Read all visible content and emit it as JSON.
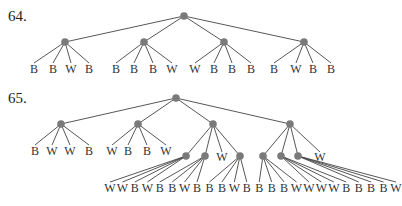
{
  "problems": [
    {
      "number": "64.",
      "root": [
        184,
        16
      ],
      "children": [
        {
          "pos": [
            65,
            42
          ],
          "leaves": [
            {
              "x": 34,
              "t": "B"
            },
            {
              "x": 53,
              "t": "B"
            },
            {
              "x": 71,
              "t": "W"
            },
            {
              "x": 89,
              "t": "B"
            }
          ]
        },
        {
          "pos": [
            144,
            42
          ],
          "leaves": [
            {
              "x": 116,
              "t": "B"
            },
            {
              "x": 134,
              "t": "B"
            },
            {
              "x": 153,
              "t": "B"
            },
            {
              "x": 172,
              "t": "W"
            }
          ]
        },
        {
          "pos": [
            224,
            42
          ],
          "leaves": [
            {
              "x": 195,
              "t": "W"
            },
            {
              "x": 214,
              "t": "B"
            },
            {
              "x": 232,
              "t": "B"
            },
            {
              "x": 251,
              "t": "B"
            }
          ]
        },
        {
          "pos": [
            304,
            42
          ],
          "leaves": [
            {
              "x": 274,
              "t": "B"
            },
            {
              "x": 296,
              "t": "W"
            },
            {
              "x": 313,
              "t": "B"
            },
            {
              "x": 331,
              "t": "B"
            }
          ]
        }
      ],
      "leaf_y": 73
    },
    {
      "number": "65.",
      "root": [
        176,
        98
      ],
      "children": [
        {
          "pos": [
            61,
            124
          ],
          "leaves": [
            {
              "x": 35,
              "t": "B"
            },
            {
              "x": 52,
              "t": "W"
            },
            {
              "x": 70,
              "t": "W"
            },
            {
              "x": 89,
              "t": "B"
            }
          ]
        },
        {
          "pos": [
            138,
            124
          ],
          "leaves": [
            {
              "x": 112,
              "t": "W"
            },
            {
              "x": 128,
              "t": "B"
            },
            {
              "x": 147,
              "t": "B"
            },
            {
              "x": 166,
              "t": "W"
            }
          ]
        },
        {
          "pos": [
            213,
            124
          ],
          "leaves": [],
          "sub": [
            {
              "pos": [
                186,
                156
              ]
            },
            {
              "pos": [
                205,
                156
              ]
            },
            {
              "leaf": {
                "x": 222,
                "y": 161,
                "t": "W"
              }
            },
            {
              "pos": [
                240,
                156
              ]
            }
          ]
        },
        {
          "pos": [
            290,
            124
          ],
          "leaves": [],
          "sub": [
            {
              "pos": [
                263,
                156
              ]
            },
            {
              "pos": [
                281,
                156
              ]
            },
            {
              "pos": [
                298,
                156
              ]
            },
            {
              "leaf": {
                "x": 320,
                "y": 161,
                "t": "W"
              }
            }
          ]
        }
      ],
      "bottom_leaves": [
        "W",
        "W",
        "B",
        "W",
        "B",
        "B",
        "W",
        "B",
        "B",
        "B",
        "W",
        "B",
        "B",
        "B",
        "B",
        "W",
        "W",
        "W",
        "W",
        "B",
        "B",
        "B",
        "B",
        "W"
      ],
      "bottom_y": 192
    }
  ],
  "colors": {
    "node": "#7a7a7a",
    "edge": "#444444",
    "text": "#333333"
  }
}
